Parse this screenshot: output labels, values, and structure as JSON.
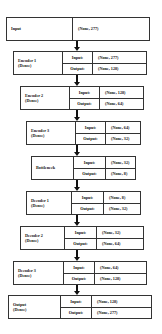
{
  "diagram": {
    "input_layer": {
      "name": "Input",
      "shape": "(None, 277)"
    },
    "port_labels": {
      "input": "Input:",
      "output": "Output:"
    },
    "layers": [
      {
        "name": "Encoder 1",
        "type": "(Dense)",
        "input": "(None, 277)",
        "output": "(None, 128)"
      },
      {
        "name": "Encoder 2",
        "type": "(Dense)",
        "input": "(None, 128)",
        "output": "(None, 64)"
      },
      {
        "name": "Encoder 3",
        "type": "(Dense)",
        "input": "(None, 64)",
        "output": "(None, 32)"
      },
      {
        "name": "Bottleneck",
        "type": "",
        "input": "(None, 32)",
        "output": "(None, 8)"
      },
      {
        "name": "Decoder 1",
        "type": "(Dense)",
        "input": "(None, 8)",
        "output": "(None, 32)"
      },
      {
        "name": "Decoder 2",
        "type": "(Dense)",
        "input": "(None, 32)",
        "output": "(None, 64)"
      },
      {
        "name": "Decoder 3",
        "type": "(Dense)",
        "input": "(None, 64)",
        "output": "(None, 128)"
      },
      {
        "name": "Output",
        "type": "(Dense)",
        "input": "(None, 128)",
        "output": "(None, 277)"
      }
    ]
  }
}
